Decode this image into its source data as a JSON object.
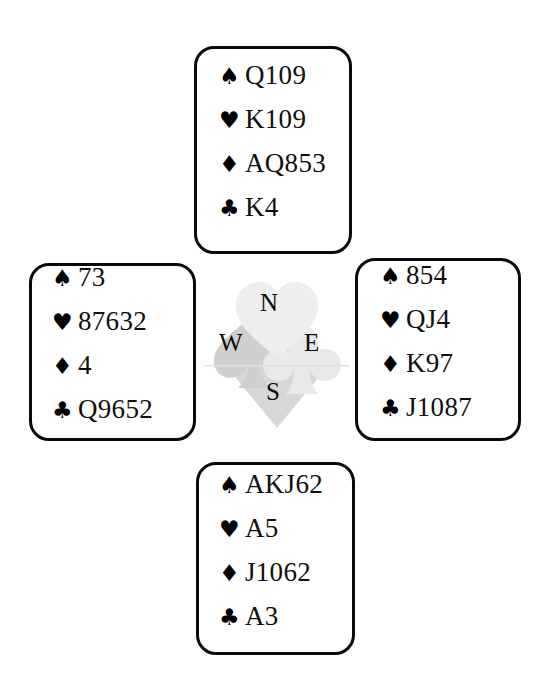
{
  "diagram": {
    "type": "bridge-hand-deal",
    "background_color": "#ffffff",
    "ink_color": "#000000",
    "watermark_color": "#c9c9c9"
  },
  "suits": {
    "spade_pip": "♠",
    "heart_pip": "♥",
    "diamond_pip": "♦",
    "club_pip": "♣"
  },
  "compass": {
    "north": "N",
    "west": "W",
    "east": "E",
    "south": "S"
  },
  "hands": {
    "north": {
      "position": "North",
      "spades": "Q109",
      "hearts": "K109",
      "diamonds": "AQ853",
      "clubs": "K4"
    },
    "west": {
      "position": "West",
      "spades": "73",
      "hearts": "87632",
      "diamonds": "4",
      "clubs": "Q9652"
    },
    "east": {
      "position": "East",
      "spades": "854",
      "hearts": "QJ4",
      "diamonds": "K97",
      "clubs": "J1087"
    },
    "south": {
      "position": "South",
      "spades": "AKJ62",
      "hearts": "A5",
      "diamonds": "J1062",
      "clubs": "A3"
    }
  }
}
